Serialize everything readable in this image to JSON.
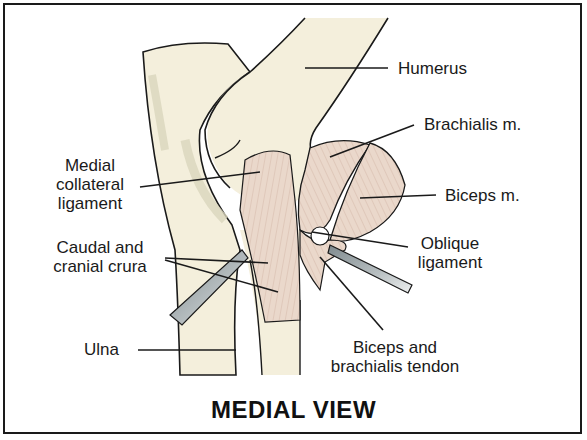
{
  "diagram": {
    "title": "MEDIAL VIEW",
    "colors": {
      "bone": "#f4efdc",
      "bone_shadow": "#d9d6bd",
      "muscle": "#ead8cb",
      "muscle_lines": "#c9a99a",
      "outline": "#1a1a1a",
      "retractor": "#9aa3a6"
    },
    "labels": {
      "humerus": "Humerus",
      "brachialis": "Brachialis m.",
      "biceps": "Biceps m.",
      "medial_collateral_1": "Medial",
      "medial_collateral_2": "collateral",
      "medial_collateral_3": "ligament",
      "crura_1": "Caudal and",
      "crura_2": "cranial crura",
      "oblique_1": "Oblique",
      "oblique_2": "ligament",
      "ulna": "Ulna",
      "tendon_1": "Biceps and",
      "tendon_2": "brachialis tendon"
    }
  }
}
